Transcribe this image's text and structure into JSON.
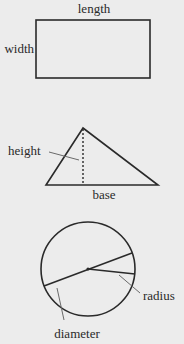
{
  "rectangle": {
    "top_label": "length",
    "side_label": "width"
  },
  "triangle": {
    "height_label": "height",
    "base_label": "base"
  },
  "circle": {
    "radius_label": "radius",
    "diameter_label": "diameter"
  },
  "colors": {
    "background": "#ececec",
    "stroke": "#2a2a2a",
    "leader": "#6a6a6a"
  }
}
